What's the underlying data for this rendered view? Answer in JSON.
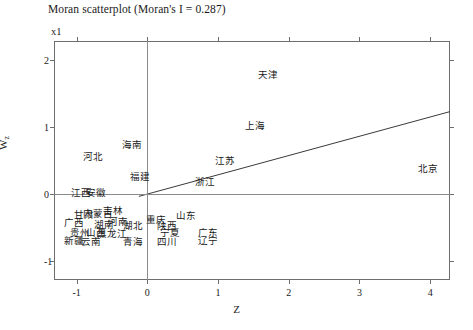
{
  "chart_data": {
    "type": "scatter",
    "title": "Moran scatterplot (Moran's I = 0.287)",
    "corner_annotation": "x1",
    "xlabel": "Z",
    "ylabel": "W",
    "ylabel_subscript": "z",
    "xlim": [
      -1.32,
      4.28
    ],
    "ylim": [
      -1.28,
      2.28
    ],
    "xticks": [
      -1,
      0,
      1,
      2,
      3,
      4
    ],
    "xtick_labels": [
      "-1",
      "0",
      "1",
      "2",
      "3",
      "4"
    ],
    "yticks": [
      -1,
      0,
      1,
      2
    ],
    "ytick_labels": [
      "-1",
      "0",
      "1",
      "2"
    ],
    "grid": false,
    "legend": "none",
    "morans_i": 0.287,
    "reference_lines": {
      "vertical_x": 0,
      "horizontal_y": 0
    },
    "regression_line": {
      "slope": 0.287,
      "intercept": 0,
      "x_start": -0.12,
      "x_end": 4.28
    },
    "point_label_mode": "text-only",
    "points": [
      {
        "label": "天津",
        "x": 1.7,
        "y": 1.78
      },
      {
        "label": "上海",
        "x": 1.52,
        "y": 1.02
      },
      {
        "label": "海南",
        "x": -0.21,
        "y": 0.73
      },
      {
        "label": "河北",
        "x": -0.77,
        "y": 0.55
      },
      {
        "label": "江苏",
        "x": 1.1,
        "y": 0.5
      },
      {
        "label": "北京",
        "x": 3.97,
        "y": 0.38
      },
      {
        "label": "福建",
        "x": -0.11,
        "y": 0.25
      },
      {
        "label": "浙江",
        "x": 0.81,
        "y": 0.18
      },
      {
        "label": "江西",
        "x": -0.94,
        "y": 0.02
      },
      {
        "label": "安徽",
        "x": -0.72,
        "y": 0.02
      },
      {
        "label": "甘肃",
        "x": -0.9,
        "y": -0.31
      },
      {
        "label": "内蒙古",
        "x": -0.7,
        "y": -0.3
      },
      {
        "label": "吉林",
        "x": -0.48,
        "y": -0.25
      },
      {
        "label": "山东",
        "x": 0.55,
        "y": -0.32
      },
      {
        "label": "广西",
        "x": -1.04,
        "y": -0.43
      },
      {
        "label": "湖南",
        "x": -0.62,
        "y": -0.46
      },
      {
        "label": "河南",
        "x": -0.41,
        "y": -0.41
      },
      {
        "label": "湖北",
        "x": -0.2,
        "y": -0.47
      },
      {
        "label": "重庆",
        "x": 0.12,
        "y": -0.39
      },
      {
        "label": "陕西",
        "x": 0.28,
        "y": -0.47
      },
      {
        "label": "贵州",
        "x": -0.95,
        "y": -0.58
      },
      {
        "label": "山西",
        "x": -0.72,
        "y": -0.58
      },
      {
        "label": "黑龙江",
        "x": -0.5,
        "y": -0.6
      },
      {
        "label": "宁夏",
        "x": 0.32,
        "y": -0.58
      },
      {
        "label": "广东",
        "x": 0.86,
        "y": -0.58
      },
      {
        "label": "新疆",
        "x": -1.04,
        "y": -0.7
      },
      {
        "label": "云南",
        "x": -0.8,
        "y": -0.71
      },
      {
        "label": "青海",
        "x": -0.2,
        "y": -0.71
      },
      {
        "label": "四川",
        "x": 0.28,
        "y": -0.72
      },
      {
        "label": "辽宁",
        "x": 0.86,
        "y": -0.7
      }
    ]
  },
  "colors": {
    "frame": "#6e6e6e",
    "text": "#1a1a1a",
    "reference_line": "#8a8a8a",
    "regression_line": "#3a3a3a",
    "background": "#ffffff"
  }
}
